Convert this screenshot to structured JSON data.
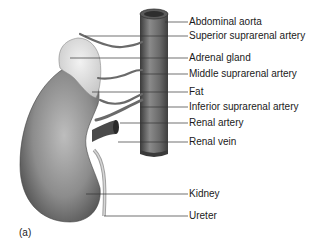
{
  "figure": {
    "panel_label": "(a)",
    "labels": [
      {
        "text": "Abdominal aorta",
        "y": 22
      },
      {
        "text": "Superior suprarenal artery",
        "y": 36
      },
      {
        "text": "Adrenal gland",
        "y": 58
      },
      {
        "text": "Middle suprarenal artery",
        "y": 74
      },
      {
        "text": "Fat",
        "y": 92
      },
      {
        "text": "Inferior suprarenal artery",
        "y": 107
      },
      {
        "text": "Renal artery",
        "y": 123
      },
      {
        "text": "Renal vein",
        "y": 142
      },
      {
        "text": "Kidney",
        "y": 194
      },
      {
        "text": "Ureter",
        "y": 216
      }
    ]
  }
}
